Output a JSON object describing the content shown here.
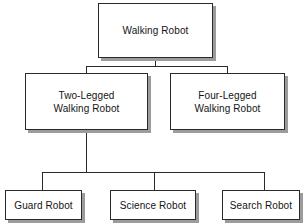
{
  "diagram": {
    "type": "hierarchy-tree",
    "orientation": "top-down",
    "levels": 3,
    "style": {
      "box_fill": "#ffffff",
      "box_border": "#2b2b2b",
      "box_shadow": "#9c9c9c",
      "line_color": "#2b2b2b",
      "text_color": "#141414",
      "background": "#ffffff"
    },
    "nodes": [
      {
        "id": "walking-robot",
        "label": "Walking Robot",
        "level": 1,
        "parent": null,
        "x": 98,
        "y": 3,
        "w": 115,
        "h": 55
      },
      {
        "id": "two-legged-walking-robot",
        "label": "Two-Legged\nWalking Robot",
        "level": 2,
        "parent": "walking-robot",
        "x": 25,
        "y": 73,
        "w": 123,
        "h": 57
      },
      {
        "id": "four-legged-walking-robot",
        "label": "Four-Legged\nWalking Robot",
        "level": 2,
        "parent": "walking-robot",
        "x": 170,
        "y": 73,
        "w": 115,
        "h": 57
      },
      {
        "id": "guard-robot",
        "label": "Guard Robot",
        "level": 3,
        "parent": "two-legged-walking-robot",
        "x": 5,
        "y": 190,
        "w": 77,
        "h": 30
      },
      {
        "id": "science-robot",
        "label": "Science Robot",
        "level": 3,
        "parent": "two-legged-walking-robot",
        "x": 110,
        "y": 190,
        "w": 86,
        "h": 30
      },
      {
        "id": "search-robot",
        "label": "Search Robot",
        "level": 3,
        "parent": "two-legged-walking-robot",
        "x": 222,
        "y": 190,
        "w": 78,
        "h": 30
      }
    ],
    "edges": [
      {
        "from": "walking-robot",
        "to": "two-legged-walking-robot"
      },
      {
        "from": "walking-robot",
        "to": "four-legged-walking-robot"
      },
      {
        "from": "two-legged-walking-robot",
        "to": "guard-robot"
      },
      {
        "from": "two-legged-walking-robot",
        "to": "science-robot"
      },
      {
        "from": "two-legged-walking-robot",
        "to": "search-robot"
      }
    ]
  }
}
